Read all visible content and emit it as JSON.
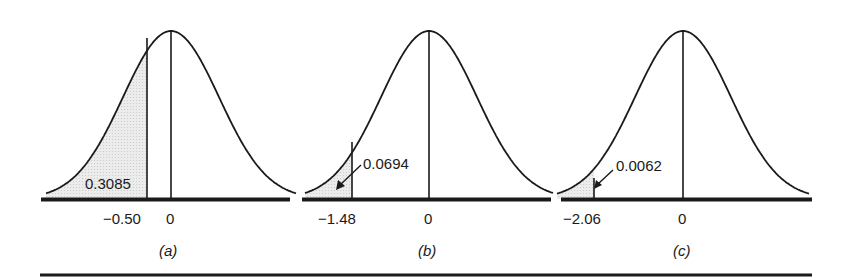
{
  "chart_data": [
    {
      "type": "area",
      "title": "",
      "caption": "(a)",
      "description": "Standard normal curve with left-tail area shaded up to z = -0.50",
      "xlabel": "",
      "ylabel": "",
      "x_ticks": [
        "-0.50",
        "0"
      ],
      "cut_z": -0.5,
      "shaded_area": 0.3085,
      "shaded_area_label": "0.3085",
      "shaded_region": "left tail",
      "grid": false
    },
    {
      "type": "area",
      "title": "",
      "caption": "(b)",
      "description": "Standard normal curve with left-tail area shaded up to z = -1.48",
      "xlabel": "",
      "ylabel": "",
      "x_ticks": [
        "-1.48",
        "0"
      ],
      "cut_z": -1.48,
      "shaded_area": 0.0694,
      "shaded_area_label": "0.0694",
      "shaded_region": "left tail",
      "annotation_arrow": true,
      "grid": false
    },
    {
      "type": "area",
      "title": "",
      "caption": "(c)",
      "description": "Standard normal curve with left-tail area shaded up to z = -2.06",
      "xlabel": "",
      "ylabel": "",
      "x_ticks": [
        "-2.06",
        "0"
      ],
      "cut_z": -2.06,
      "shaded_area": 0.0062,
      "shaded_area_label": "0.0062",
      "shaded_region": "left tail",
      "annotation_arrow": true,
      "grid": false
    }
  ],
  "panels": {
    "a": {
      "area_label": "0.3085",
      "cut_label": "−0.50",
      "zero_label": "0",
      "caption": "(a)"
    },
    "b": {
      "area_label": "0.0694",
      "cut_label": "−1.48",
      "zero_label": "0",
      "caption": "(b)"
    },
    "c": {
      "area_label": "0.0062",
      "cut_label": "−2.06",
      "zero_label": "0",
      "caption": "(c)"
    }
  },
  "colors": {
    "ink": "#1a1a1a",
    "shade": "#e4e4e4"
  }
}
